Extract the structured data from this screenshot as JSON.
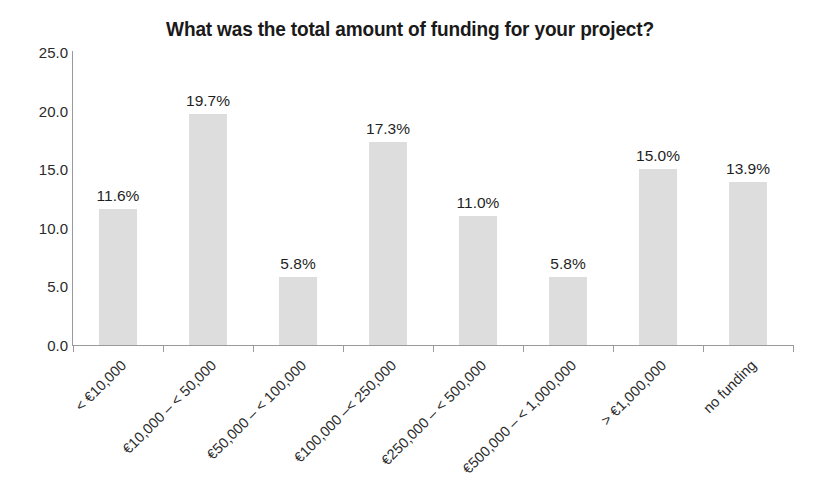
{
  "chart_data": {
    "type": "bar",
    "title": "What was the total amount of funding for your project?",
    "xlabel": "",
    "ylabel": "",
    "ylim": [
      0,
      25
    ],
    "yticks": [
      "0.0",
      "5.0",
      "10.0",
      "15.0",
      "20.0",
      "25.0"
    ],
    "ytick_values": [
      0,
      5,
      10,
      15,
      20,
      25
    ],
    "grid": false,
    "legend": "none",
    "bar_color": "#dddddd",
    "axis_color": "#9a9a9a",
    "text_color": "#231f20",
    "categories": [
      "< €10,000",
      "€10,000 – < 50,000",
      "€50,000 – < 100,000",
      "€100,000 –< 250,000",
      "€250,000 – < 500,000",
      "€500,000 – < 1,000,000",
      "> €1,000,000",
      "no funding"
    ],
    "values": [
      11.6,
      19.7,
      5.8,
      17.3,
      11.0,
      5.8,
      15.0,
      13.9
    ],
    "value_labels": [
      "11.6%",
      "19.7%",
      "5.8%",
      "17.3%",
      "11.0%",
      "5.8%",
      "15.0%",
      "13.9%"
    ]
  }
}
